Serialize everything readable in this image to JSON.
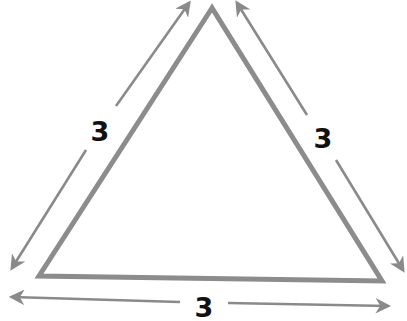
{
  "diagram": {
    "type": "equilateral-triangle-with-side-lengths",
    "colors": {
      "stroke": "#8c8c8c",
      "arrow": "#8a8a8a",
      "label": "#111111",
      "background": "#ffffff"
    },
    "triangle": {
      "vertices": [
        [
          212,
          8
        ],
        [
          39,
          276
        ],
        [
          382,
          281
        ]
      ]
    },
    "sides": [
      {
        "name": "left",
        "label": "3",
        "label_pos": [
          100,
          131
        ]
      },
      {
        "name": "right",
        "label": "3",
        "label_pos": [
          323,
          138
        ]
      },
      {
        "name": "bottom",
        "label": "3",
        "label_pos": [
          204,
          307
        ]
      }
    ]
  }
}
